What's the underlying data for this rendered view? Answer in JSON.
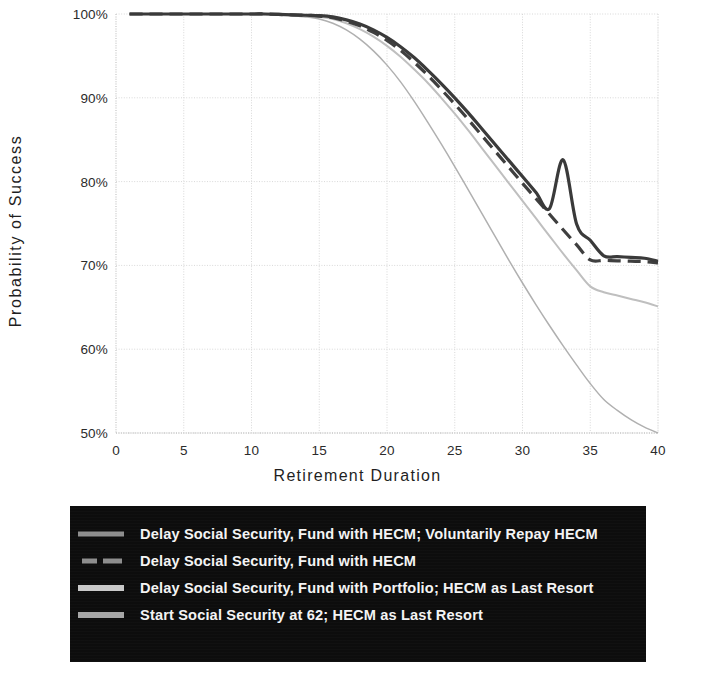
{
  "chart_data": {
    "type": "line",
    "title": "",
    "xlabel": "Retirement Duration",
    "ylabel": "Probability of Success",
    "xlim": [
      0,
      40
    ],
    "ylim": [
      0.5,
      1.0
    ],
    "xticks": [
      "0",
      "5",
      "10",
      "15",
      "20",
      "25",
      "30",
      "35",
      "40"
    ],
    "xtick_values": [
      0,
      5,
      10,
      15,
      20,
      25,
      30,
      35,
      40
    ],
    "yticks": [
      "50%",
      "60%",
      "70%",
      "80%",
      "90%",
      "100%"
    ],
    "ytick_values": [
      0.5,
      0.6,
      0.7,
      0.8,
      0.9,
      1.0
    ],
    "grid": true,
    "legend_position": "below-plot",
    "x": [
      1,
      2,
      3,
      4,
      5,
      6,
      7,
      8,
      9,
      10,
      11,
      12,
      13,
      14,
      15,
      16,
      17,
      18,
      19,
      20,
      21,
      22,
      23,
      24,
      25,
      26,
      27,
      28,
      29,
      30,
      31,
      32,
      33,
      34,
      35,
      36,
      37,
      38,
      39,
      40
    ],
    "series": [
      {
        "name": "Delay Social Security, Fund with HECM; Voluntarily Repay HECM",
        "style": "solid",
        "color": "#3a3a3a",
        "width": 3.2,
        "values": [
          1.0,
          1.0,
          1.0,
          1.0,
          1.0,
          1.0,
          1.0,
          1.0,
          1.0,
          1.0,
          1.0,
          0.9995,
          0.999,
          0.9985,
          0.998,
          0.9965,
          0.993,
          0.988,
          0.981,
          0.972,
          0.961,
          0.948,
          0.933,
          0.917,
          0.9,
          0.882,
          0.863,
          0.844,
          0.825,
          0.806,
          0.787,
          0.768,
          0.826,
          0.749,
          0.73,
          0.7115,
          0.7105,
          0.7095,
          0.7085,
          0.705
        ]
      },
      {
        "name": "Delay Social Security, Fund with HECM",
        "style": "dashed",
        "color": "#3f3f3f",
        "width": 3.2,
        "values": [
          1.0,
          1.0,
          1.0,
          1.0,
          1.0,
          1.0,
          1.0,
          1.0,
          1.0,
          1.0,
          1.0,
          0.9995,
          0.999,
          0.9985,
          0.9975,
          0.9955,
          0.9915,
          0.986,
          0.978,
          0.9685,
          0.9565,
          0.9425,
          0.927,
          0.91,
          0.8925,
          0.874,
          0.855,
          0.836,
          0.817,
          0.798,
          0.7795,
          0.761,
          0.7425,
          0.7245,
          0.7065,
          0.706,
          0.7055,
          0.705,
          0.7045,
          0.703
        ]
      },
      {
        "name": "Delay Social Security, Fund with Portfolio; HECM as Last Resort",
        "style": "solid",
        "color": "#bfbfbf",
        "width": 2.0,
        "values": [
          1.0,
          1.0,
          1.0,
          1.0,
          1.0,
          1.0,
          1.0,
          1.0,
          1.0,
          1.0,
          1.0,
          0.9995,
          0.999,
          0.998,
          0.9965,
          0.994,
          0.989,
          0.982,
          0.973,
          0.962,
          0.949,
          0.934,
          0.918,
          0.9,
          0.881,
          0.861,
          0.84,
          0.819,
          0.798,
          0.777,
          0.756,
          0.735,
          0.714,
          0.694,
          0.675,
          0.668,
          0.664,
          0.66,
          0.656,
          0.651
        ]
      },
      {
        "name": "Start Social Security at 62; HECM as Last Resort",
        "style": "solid",
        "color": "#b0b0b0",
        "width": 1.5,
        "values": [
          1.0,
          1.0,
          1.0,
          1.0,
          1.0,
          1.0,
          1.0,
          1.0,
          1.0,
          1.0,
          0.9995,
          0.999,
          0.998,
          0.9965,
          0.994,
          0.989,
          0.981,
          0.97,
          0.956,
          0.939,
          0.919,
          0.896,
          0.871,
          0.845,
          0.818,
          0.79,
          0.762,
          0.734,
          0.706,
          0.679,
          0.653,
          0.628,
          0.604,
          0.581,
          0.559,
          0.54,
          0.527,
          0.516,
          0.507,
          0.5
        ]
      }
    ]
  },
  "legend": {
    "items": [
      {
        "label": "Delay Social Security, Fund with HECM; Voluntarily Repay HECM",
        "swatch": "solid-dark"
      },
      {
        "label": "Delay Social Security, Fund with HECM",
        "swatch": "dashed"
      },
      {
        "label": "Delay Social Security, Fund with Portfolio; HECM as Last Resort",
        "swatch": "solid-mid"
      },
      {
        "label": "Start Social Security at 62; HECM as Last Resort",
        "swatch": "solid-light"
      }
    ]
  },
  "colors": {
    "legend_background": "#0d0d0d",
    "legend_text": "#f4f4f4",
    "grid": "#d8d8d8",
    "axis": "#c9c9c9",
    "tick_text": "#2b2b2b"
  }
}
